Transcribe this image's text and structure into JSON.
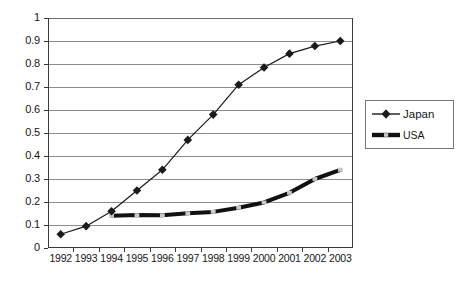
{
  "chart_data": {
    "type": "line",
    "title": "",
    "subtitle": "",
    "xlabel": "",
    "ylabel": "",
    "categories": [
      "1992",
      "1993",
      "1994",
      "1995",
      "1996",
      "1997",
      "1998",
      "1999",
      "2000",
      "2001",
      "2002",
      "2003"
    ],
    "ylim": [
      0,
      1
    ],
    "ytick_labels": [
      "0",
      "0.1",
      "0.2",
      "0.3",
      "0.4",
      "0.5",
      "0.6",
      "0.7",
      "0.8",
      "0.9",
      "1"
    ],
    "ytick_values": [
      0,
      0.1,
      0.2,
      0.3,
      0.4,
      0.5,
      0.6,
      0.7,
      0.8,
      0.9,
      1
    ],
    "grid": "horizontal",
    "legend_position": "right",
    "series": [
      {
        "name": "Japan",
        "marker": "diamond",
        "color": "#1a1a1a",
        "line_width": 1.2,
        "x": [
          "1992",
          "1993",
          "1994",
          "1995",
          "1996",
          "1997",
          "1998",
          "1999",
          "2000",
          "2001",
          "2002",
          "2003"
        ],
        "values": [
          0.06,
          0.095,
          0.16,
          0.25,
          0.34,
          0.47,
          0.58,
          0.71,
          0.785,
          0.845,
          0.878,
          0.9
        ]
      },
      {
        "name": "USA",
        "marker": "square-small",
        "color": "#111111",
        "line_width": 4.0,
        "x": [
          "1994",
          "1995",
          "1996",
          "1997",
          "1998",
          "1999",
          "2000",
          "2001",
          "2002",
          "2003"
        ],
        "values": [
          0.14,
          0.143,
          0.142,
          0.151,
          0.157,
          0.175,
          0.198,
          0.24,
          0.3,
          0.34
        ]
      }
    ]
  },
  "legend": {
    "items": [
      {
        "label": "Japan",
        "marker": "diamond"
      },
      {
        "label": "USA",
        "marker": "thick-line"
      }
    ]
  }
}
